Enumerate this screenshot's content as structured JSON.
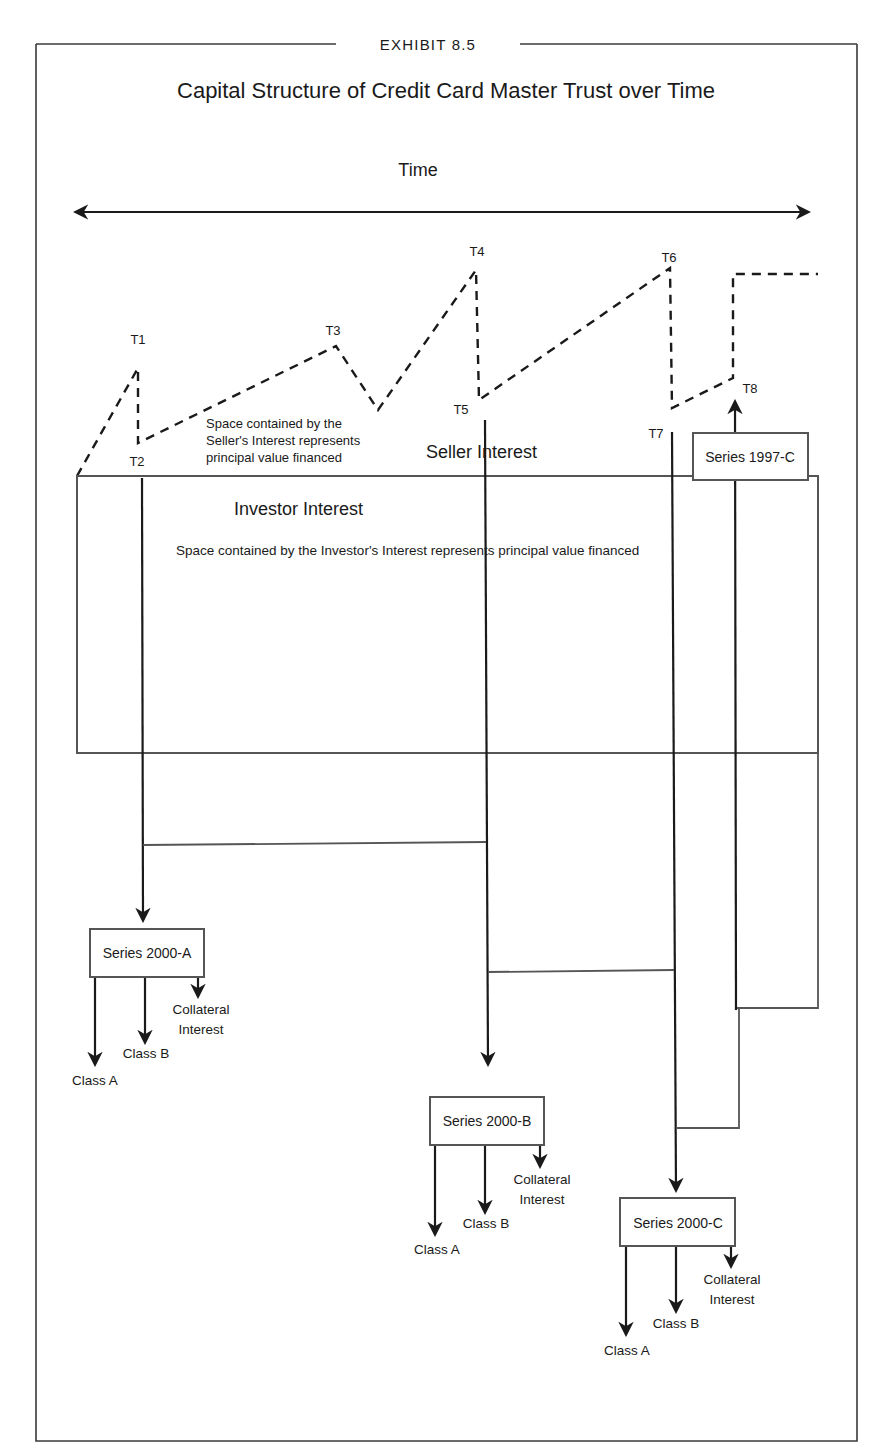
{
  "exhibit": {
    "label": "EXHIBIT 8.5",
    "title": "Capital Structure of Credit Card Master Trust over Time"
  },
  "time_axis": {
    "label": "Time",
    "direction": "bidirectional-arrow"
  },
  "time_points": [
    {
      "id": "T1",
      "label": "T1"
    },
    {
      "id": "T2",
      "label": "T2"
    },
    {
      "id": "T3",
      "label": "T3"
    },
    {
      "id": "T4",
      "label": "T4"
    },
    {
      "id": "T5",
      "label": "T5"
    },
    {
      "id": "T6",
      "label": "T6"
    },
    {
      "id": "T7",
      "label": "T7"
    },
    {
      "id": "T8",
      "label": "T8"
    }
  ],
  "regions": {
    "seller": {
      "title": "Seller Interest",
      "note_lines": [
        "Space contained by the",
        "Seller's Interest represents",
        "principal value financed"
      ],
      "line_style": "dashed"
    },
    "investor": {
      "title": "Investor Interest",
      "note": "Space contained by the Investor's Interest represents principal value financed",
      "line_style": "solid"
    }
  },
  "series": [
    {
      "name": "Series 2000-A",
      "issued_at": "T2",
      "tranches": [
        "Class A",
        "Class B"
      ],
      "collateral_lines": [
        "Collateral",
        "Interest"
      ]
    },
    {
      "name": "Series 2000-B",
      "issued_at": "T5",
      "tranches": [
        "Class A",
        "Class B"
      ],
      "collateral_lines": [
        "Collateral",
        "Interest"
      ]
    },
    {
      "name": "Series 2000-C",
      "issued_at": "T7",
      "tranches": [
        "Class A",
        "Class B"
      ],
      "collateral_lines": [
        "Collateral",
        "Interest"
      ]
    },
    {
      "name": "Series 1997-C",
      "matures_at": "T8",
      "direction": "up (principal returned to seller interest)"
    }
  ],
  "colors": {
    "line": "#1a1a1a",
    "frame": "#3a3a3a",
    "box_border": "#555555",
    "background": "#ffffff"
  }
}
